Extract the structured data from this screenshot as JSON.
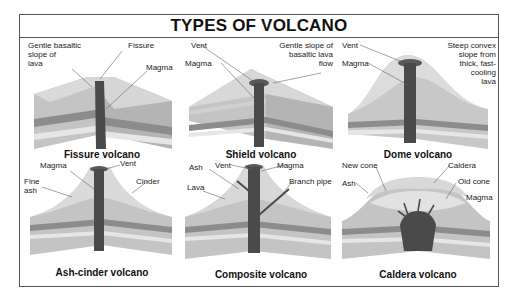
{
  "title": "TYPES OF VOLCANO",
  "colors": {
    "frame": "#555555",
    "top_surface": "#d8d8d8",
    "side_light": "#c4c4c4",
    "side_dark": "#a8a8a8",
    "layer_dark": "#8c8c8c",
    "layer_light": "#e2e2e2",
    "magma": "#4a4a4a"
  },
  "panels": [
    {
      "caption": "Fissure volcano",
      "labels": [
        "Gentle basaltic\nslope of\nlava",
        "Fissure",
        "Magma"
      ]
    },
    {
      "caption": "Shield volcano",
      "labels": [
        "Vent",
        "Magma",
        "Gentle slope of\nbasaltic lava\nflow"
      ]
    },
    {
      "caption": "Dome volcano",
      "labels": [
        "Vent",
        "Magma",
        "Steep convex\nslope from\nthick, fast-\ncooling\nlava"
      ]
    },
    {
      "caption": "Ash-cinder volcano",
      "labels": [
        "Magma",
        "Vent",
        "Fine\nash",
        "Cinder"
      ]
    },
    {
      "caption": "Composite volcano",
      "labels": [
        "Ash",
        "Vent",
        "Magma",
        "Lava",
        "Branch pipe"
      ]
    },
    {
      "caption": "Caldera volcano",
      "labels": [
        "New cone",
        "Caldera",
        "Ash",
        "Old cone",
        "Magma"
      ]
    }
  ]
}
